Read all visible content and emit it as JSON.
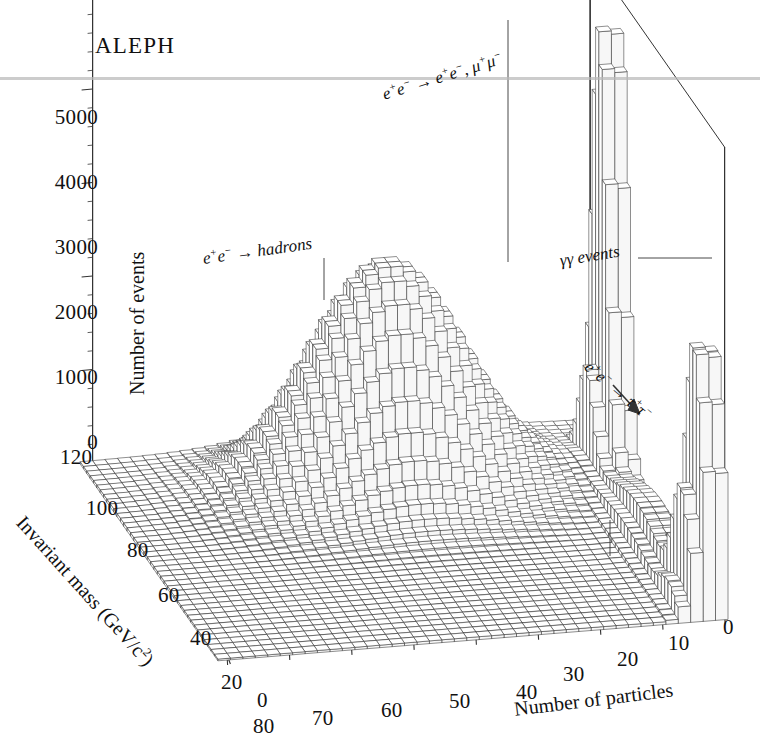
{
  "brand": {
    "label": "ALEPH"
  },
  "axes": {
    "events": {
      "title": "Number of events",
      "ticks": [
        "0",
        "1000",
        "2000",
        "3000",
        "4000",
        "5000"
      ],
      "values": [
        0,
        1000,
        2000,
        3000,
        4000,
        5000
      ]
    },
    "mass": {
      "title": "Invariant mass (GeV/c2)",
      "title_base": "Invariant mass (GeV/c",
      "title_sup": "2",
      "title_tail": ")",
      "ticks": [
        "120",
        "100",
        "80",
        "60",
        "40",
        "20",
        "0"
      ],
      "values": [
        120,
        100,
        80,
        60,
        40,
        20,
        0
      ]
    },
    "particles": {
      "title": "Number of particles",
      "ticks": [
        "80",
        "70",
        "60",
        "50",
        "40",
        "30",
        "20",
        "10",
        "0"
      ],
      "values": [
        80,
        70,
        60,
        50,
        40,
        30,
        20,
        10,
        0
      ]
    }
  },
  "annotations": {
    "dilepton": {
      "text": "e+e- → e+e-, μ+μ-"
    },
    "hadrons": {
      "text": "e+e- → hadrons"
    },
    "gammagamma": {
      "text": "γγ events"
    },
    "tau": {
      "text": "e+e- → τ+τ-"
    }
  },
  "chart_data": {
    "type": "bar",
    "title": "ALEPH",
    "subtype": "3d-lego-histogram",
    "xlabel": "Number of particles",
    "ylabel": "Invariant mass (GeV/c2)",
    "zlabel": "Number of events",
    "xlim": [
      0,
      80
    ],
    "ylim": [
      0,
      120
    ],
    "zlim": [
      0,
      5000
    ],
    "x_ticks": [
      80,
      70,
      60,
      50,
      40,
      30,
      20,
      10,
      0
    ],
    "y_ticks": [
      120,
      100,
      80,
      60,
      40,
      20,
      0
    ],
    "z_ticks": [
      0,
      1000,
      2000,
      3000,
      4000,
      5000
    ],
    "grid": false,
    "legend": "none",
    "x_axis_direction": "descending-left-to-right",
    "bin_width_particles": 2,
    "bin_width_mass": 3,
    "components": [
      {
        "name": "e+e- → hadrons",
        "peak_particles": 38,
        "peak_mass": 90,
        "peak_events": 2400,
        "sigma_particles": 12,
        "sigma_mass": 14,
        "shape": "gaussian-blob"
      },
      {
        "name": "e+e- → e+e-, μ+μ-",
        "peak_particles": 2,
        "peak_mass": 91,
        "peak_events": 5600,
        "sigma_particles": 1.6,
        "sigma_mass": 6,
        "shape": "narrow-spike"
      },
      {
        "name": "γγ events",
        "peak_particles": 2,
        "peak_mass": 6,
        "peak_events": 3000,
        "sigma_particles": 2.2,
        "sigma_mass": 7,
        "shape": "narrow-spike"
      },
      {
        "name": "e+e- → τ+τ-",
        "peak_particles": 4,
        "peak_mass": 45,
        "peak_events": 450,
        "sigma_particles": 2.4,
        "sigma_mass": 22,
        "shape": "ridge"
      }
    ],
    "background_floor_events": 60
  },
  "style": {
    "ink": "#111111",
    "line": "#333333",
    "fill": "#ffffff",
    "scan_artifact": "#b9b9b9"
  }
}
